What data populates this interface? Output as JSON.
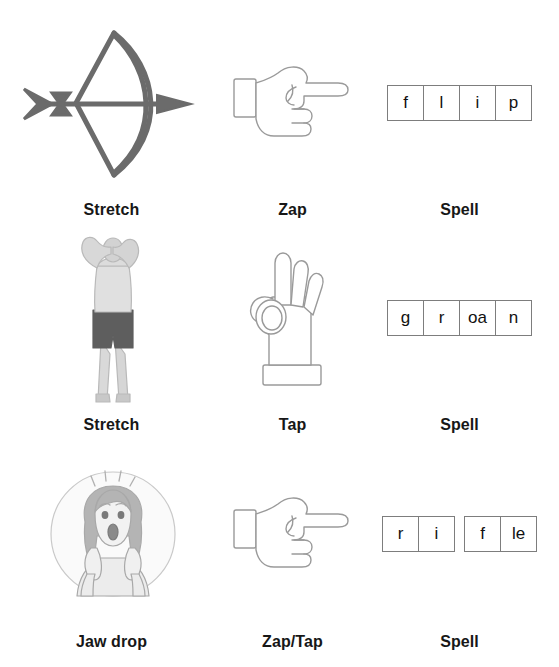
{
  "page": {
    "background_color": "#ffffff",
    "label_color": "#171717",
    "box_border_color": "#7d7d7d",
    "icon_gray": "#6b6b6b",
    "icon_outline_gray": "#9a9a9a"
  },
  "rows": [
    {
      "action": {
        "icon": "bow-and-arrow-icon",
        "label": "Stretch"
      },
      "gesture": {
        "icon": "pointing-hand-icon",
        "label": "Zap"
      },
      "spell": {
        "label": "Spell",
        "word": "flip",
        "groups": [
          {
            "graphemes": [
              "f",
              "l",
              "i",
              "p"
            ]
          }
        ]
      }
    },
    {
      "action": {
        "icon": "person-stretching-icon",
        "label": "Stretch"
      },
      "gesture": {
        "icon": "ok-hand-icon",
        "label": "Tap"
      },
      "spell": {
        "label": "Spell",
        "word": "groan",
        "groups": [
          {
            "graphemes": [
              "g",
              "r",
              "oa",
              "n"
            ]
          }
        ]
      }
    },
    {
      "action": {
        "icon": "shocked-face-icon",
        "label": "Jaw drop"
      },
      "gesture": {
        "icon": "pointing-hand-icon",
        "label": "Zap/Tap"
      },
      "spell": {
        "label": "Spell",
        "word": "rifle",
        "groups": [
          {
            "graphemes": [
              "r",
              "i"
            ]
          },
          {
            "graphemes": [
              "f",
              "le"
            ]
          }
        ]
      }
    }
  ]
}
